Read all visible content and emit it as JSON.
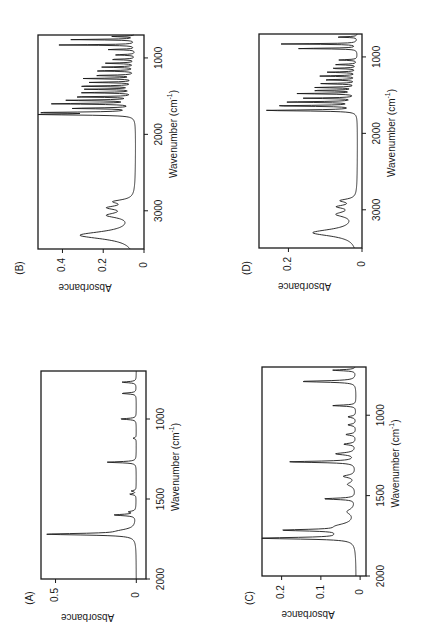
{
  "figure": {
    "background": "#ffffff",
    "ink": "#1a1a1a"
  },
  "chart_data": [
    {
      "panel": "(B)",
      "type": "line",
      "title": "",
      "xlabel": "Wavenumber (cm-1)",
      "ylabel": "Absorbance",
      "xlim": [
        3500,
        700
      ],
      "ylim": [
        0,
        0.52
      ],
      "xticks": [
        3000,
        2000,
        1000
      ],
      "yticks": [
        0,
        0.2,
        0.4
      ],
      "ytick_labels": [
        "0",
        "0.2",
        "0.4"
      ],
      "grid": false,
      "baseline": 0.04,
      "peaks": [
        {
          "x": 3320,
          "y": 0.27,
          "w": 60
        },
        {
          "x": 3060,
          "y": 0.12,
          "w": 40
        },
        {
          "x": 2960,
          "y": 0.11,
          "w": 30
        },
        {
          "x": 2880,
          "y": 0.09,
          "w": 30
        },
        {
          "x": 1740,
          "y": 0.48,
          "w": 8
        },
        {
          "x": 1715,
          "y": 0.44,
          "w": 8
        },
        {
          "x": 1660,
          "y": 0.3,
          "w": 7
        },
        {
          "x": 1600,
          "y": 0.4,
          "w": 7
        },
        {
          "x": 1555,
          "y": 0.33,
          "w": 7
        },
        {
          "x": 1510,
          "y": 0.3,
          "w": 6
        },
        {
          "x": 1455,
          "y": 0.26,
          "w": 6
        },
        {
          "x": 1410,
          "y": 0.24,
          "w": 6
        },
        {
          "x": 1370,
          "y": 0.28,
          "w": 6
        },
        {
          "x": 1320,
          "y": 0.22,
          "w": 6
        },
        {
          "x": 1270,
          "y": 0.25,
          "w": 6
        },
        {
          "x": 1230,
          "y": 0.2,
          "w": 6
        },
        {
          "x": 1170,
          "y": 0.19,
          "w": 6
        },
        {
          "x": 1120,
          "y": 0.16,
          "w": 6
        },
        {
          "x": 1070,
          "y": 0.15,
          "w": 6
        },
        {
          "x": 1020,
          "y": 0.12,
          "w": 6
        },
        {
          "x": 960,
          "y": 0.1,
          "w": 6
        },
        {
          "x": 890,
          "y": 0.14,
          "w": 5
        },
        {
          "x": 830,
          "y": 0.38,
          "w": 5
        },
        {
          "x": 760,
          "y": 0.32,
          "w": 5
        },
        {
          "x": 720,
          "y": 0.12,
          "w": 5
        }
      ],
      "frame": {
        "x": 38,
        "y": 35,
        "w": 106,
        "h": 214
      },
      "label_pos": {
        "x": 20,
        "y": 268
      }
    },
    {
      "panel": "(D)",
      "type": "line",
      "title": "",
      "xlabel": "Wavenumber (cm-1)",
      "ylabel": "Absorbance",
      "xlim": [
        3500,
        700
      ],
      "ylim": [
        0,
        0.28
      ],
      "xticks": [
        3000,
        2000,
        1000
      ],
      "yticks": [
        0,
        0.2
      ],
      "ytick_labels": [
        "0",
        "0.2"
      ],
      "grid": false,
      "baseline": 0.012,
      "peaks": [
        {
          "x": 3300,
          "y": 0.12,
          "w": 55
        },
        {
          "x": 3060,
          "y": 0.05,
          "w": 40
        },
        {
          "x": 2960,
          "y": 0.045,
          "w": 25
        },
        {
          "x": 2880,
          "y": 0.04,
          "w": 25
        },
        {
          "x": 1700,
          "y": 0.25,
          "w": 8
        },
        {
          "x": 1640,
          "y": 0.22,
          "w": 7
        },
        {
          "x": 1590,
          "y": 0.19,
          "w": 7
        },
        {
          "x": 1540,
          "y": 0.14,
          "w": 6
        },
        {
          "x": 1480,
          "y": 0.16,
          "w": 6
        },
        {
          "x": 1440,
          "y": 0.12,
          "w": 6
        },
        {
          "x": 1400,
          "y": 0.11,
          "w": 6
        },
        {
          "x": 1350,
          "y": 0.1,
          "w": 6
        },
        {
          "x": 1300,
          "y": 0.09,
          "w": 6
        },
        {
          "x": 1250,
          "y": 0.1,
          "w": 6
        },
        {
          "x": 1200,
          "y": 0.08,
          "w": 6
        },
        {
          "x": 1150,
          "y": 0.07,
          "w": 6
        },
        {
          "x": 1100,
          "y": 0.06,
          "w": 6
        },
        {
          "x": 1040,
          "y": 0.05,
          "w": 6
        },
        {
          "x": 890,
          "y": 0.17,
          "w": 5
        },
        {
          "x": 830,
          "y": 0.21,
          "w": 5
        },
        {
          "x": 740,
          "y": 0.06,
          "w": 5
        }
      ],
      "frame": {
        "x": 259,
        "y": 34,
        "w": 103,
        "h": 214
      },
      "label_pos": {
        "x": 247,
        "y": 268
      }
    },
    {
      "panel": "(A)",
      "type": "line",
      "title": "",
      "xlabel": "Wavenumber (cm-1)",
      "ylabel": "Absorbance",
      "xlim": [
        2000,
        700
      ],
      "ylim": [
        -0.06,
        0.59
      ],
      "xticks": [
        2000,
        1500,
        1000
      ],
      "yticks": [
        0,
        0.5
      ],
      "ytick_labels": [
        "0",
        "0.5"
      ],
      "grid": false,
      "baseline": 0.0,
      "peaks": [
        {
          "x": 1720,
          "y": 0.53,
          "w": 6
        },
        {
          "x": 1700,
          "y": 0.08,
          "w": 15
        },
        {
          "x": 1600,
          "y": 0.135,
          "w": 5
        },
        {
          "x": 1580,
          "y": 0.04,
          "w": 5
        },
        {
          "x": 1470,
          "y": 0.04,
          "w": 4
        },
        {
          "x": 1450,
          "y": 0.03,
          "w": 4
        },
        {
          "x": 1270,
          "y": 0.18,
          "w": 4
        },
        {
          "x": 1120,
          "y": 0.02,
          "w": 4
        },
        {
          "x": 1000,
          "y": 0.1,
          "w": 4
        },
        {
          "x": 840,
          "y": 0.09,
          "w": 4
        },
        {
          "x": 770,
          "y": 0.09,
          "w": 4
        }
      ],
      "frame": {
        "x": 41,
        "y": 371,
        "w": 105,
        "h": 208
      },
      "label_pos": {
        "x": 30,
        "y": 598
      }
    },
    {
      "panel": "(C)",
      "type": "line",
      "title": "",
      "xlabel": "Wavenumber (cm-1)",
      "ylabel": "Absorbance",
      "xlim": [
        2000,
        700
      ],
      "ylim": [
        -0.015,
        0.25
      ],
      "xticks": [
        2000,
        1500,
        1000
      ],
      "yticks": [
        0,
        0.1,
        0.2
      ],
      "ytick_labels": [
        "0",
        "0.1",
        "0.2"
      ],
      "grid": false,
      "baseline": 0.01,
      "peaks": [
        {
          "x": 1765,
          "y": 0.23,
          "w": 6
        },
        {
          "x": 1740,
          "y": 0.03,
          "w": 20
        },
        {
          "x": 1715,
          "y": 0.16,
          "w": 6
        },
        {
          "x": 1690,
          "y": 0.04,
          "w": 20
        },
        {
          "x": 1600,
          "y": 0.02,
          "w": 20
        },
        {
          "x": 1520,
          "y": 0.08,
          "w": 5
        },
        {
          "x": 1430,
          "y": 0.02,
          "w": 15
        },
        {
          "x": 1380,
          "y": 0.03,
          "w": 10
        },
        {
          "x": 1290,
          "y": 0.17,
          "w": 5
        },
        {
          "x": 1240,
          "y": 0.05,
          "w": 8
        },
        {
          "x": 1180,
          "y": 0.03,
          "w": 6
        },
        {
          "x": 1120,
          "y": 0.025,
          "w": 6
        },
        {
          "x": 1060,
          "y": 0.02,
          "w": 6
        },
        {
          "x": 1010,
          "y": 0.02,
          "w": 6
        },
        {
          "x": 940,
          "y": 0.06,
          "w": 4
        },
        {
          "x": 790,
          "y": 0.14,
          "w": 5
        },
        {
          "x": 720,
          "y": 0.06,
          "w": 4
        }
      ],
      "frame": {
        "x": 262,
        "y": 367,
        "w": 104,
        "h": 209
      },
      "label_pos": {
        "x": 250,
        "y": 598
      }
    }
  ]
}
